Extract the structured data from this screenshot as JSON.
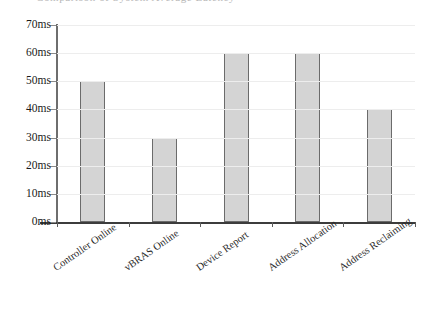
{
  "cropped_title": "Comparison of System Average Latency",
  "chart_data": {
    "type": "bar",
    "title": "",
    "xlabel": "",
    "ylabel": "",
    "categories": [
      "Controller Online",
      "vBRAS Online",
      "Device Report",
      "Address Allocation",
      "Address Reclaiming"
    ],
    "values": [
      50,
      30,
      60,
      60,
      40
    ],
    "unit": "ms",
    "ylim": [
      0,
      70
    ],
    "ytick_step": 10,
    "ytick_labels": [
      "0ms",
      "10ms",
      "20ms",
      "30ms",
      "40ms",
      "50ms",
      "60ms",
      "70ms"
    ],
    "ytick_values": [
      0,
      10,
      20,
      30,
      40,
      50,
      60,
      70
    ],
    "grid": "horizontal",
    "legend": "none",
    "bar_fill_color": "#d4d4d4",
    "bar_border_color": "#6b6b6b",
    "gridline_color": "#ededed",
    "axis_color": "#3c3c3c",
    "background_color": "#ffffff",
    "xtick_label_rotation": -35
  }
}
